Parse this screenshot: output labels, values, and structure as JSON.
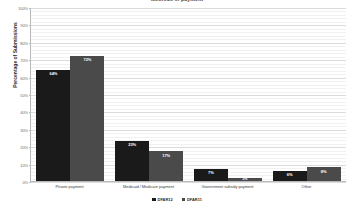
{
  "chart_data": {
    "type": "bar",
    "title": "Methods of payment",
    "xlabel": "",
    "ylabel": "Percentage of Submissions",
    "ylim": [
      0,
      100
    ],
    "ytick_labels": [
      "0%",
      "10%",
      "20%",
      "30%",
      "40%",
      "50%",
      "60%",
      "70%",
      "80%",
      "90%",
      "100%"
    ],
    "ytick_values": [
      0,
      10,
      20,
      30,
      40,
      50,
      60,
      70,
      80,
      90,
      100
    ],
    "grid": true,
    "legend_position": "bottom",
    "categories": [
      "Private payment",
      "Medicaid / Medicare payment",
      "Government subsidy payment",
      "Other"
    ],
    "series": [
      {
        "name": "DFAR12",
        "color": "#1a1a1a",
        "values": [
          64,
          23,
          7,
          6
        ],
        "labels": [
          "64%",
          "23%",
          "7%",
          "6%"
        ]
      },
      {
        "name": "DFAR11",
        "color": "#4a4a4a",
        "values": [
          72,
          17,
          2,
          8
        ],
        "labels": [
          "72%",
          "17%",
          "2%",
          "8%"
        ]
      }
    ]
  },
  "colors": {
    "series1": "#1a1a1a",
    "series2": "#4a4a4a",
    "axis": "#b9b9b9",
    "gridline": "#e6e6e6",
    "background": "#ffffff"
  }
}
